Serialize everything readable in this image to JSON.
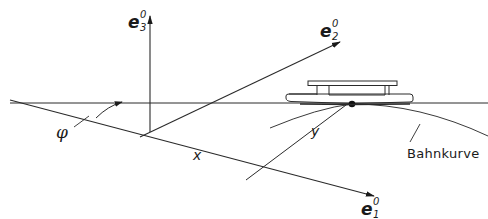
{
  "diagram": {
    "type": "kinematics-coordinate-sketch",
    "axes": [
      {
        "id": "e1",
        "symbol": "e",
        "sup": "0",
        "sub": "1"
      },
      {
        "id": "e2",
        "symbol": "e",
        "sup": "0",
        "sub": "2"
      },
      {
        "id": "e3",
        "symbol": "e",
        "sup": "0",
        "sub": "3"
      }
    ],
    "labels": {
      "angle": "φ",
      "x": "x",
      "y": "y",
      "path": "Bahnkurve"
    },
    "colors": {
      "line": "#2a2a2a",
      "background": "#ffffff"
    }
  }
}
